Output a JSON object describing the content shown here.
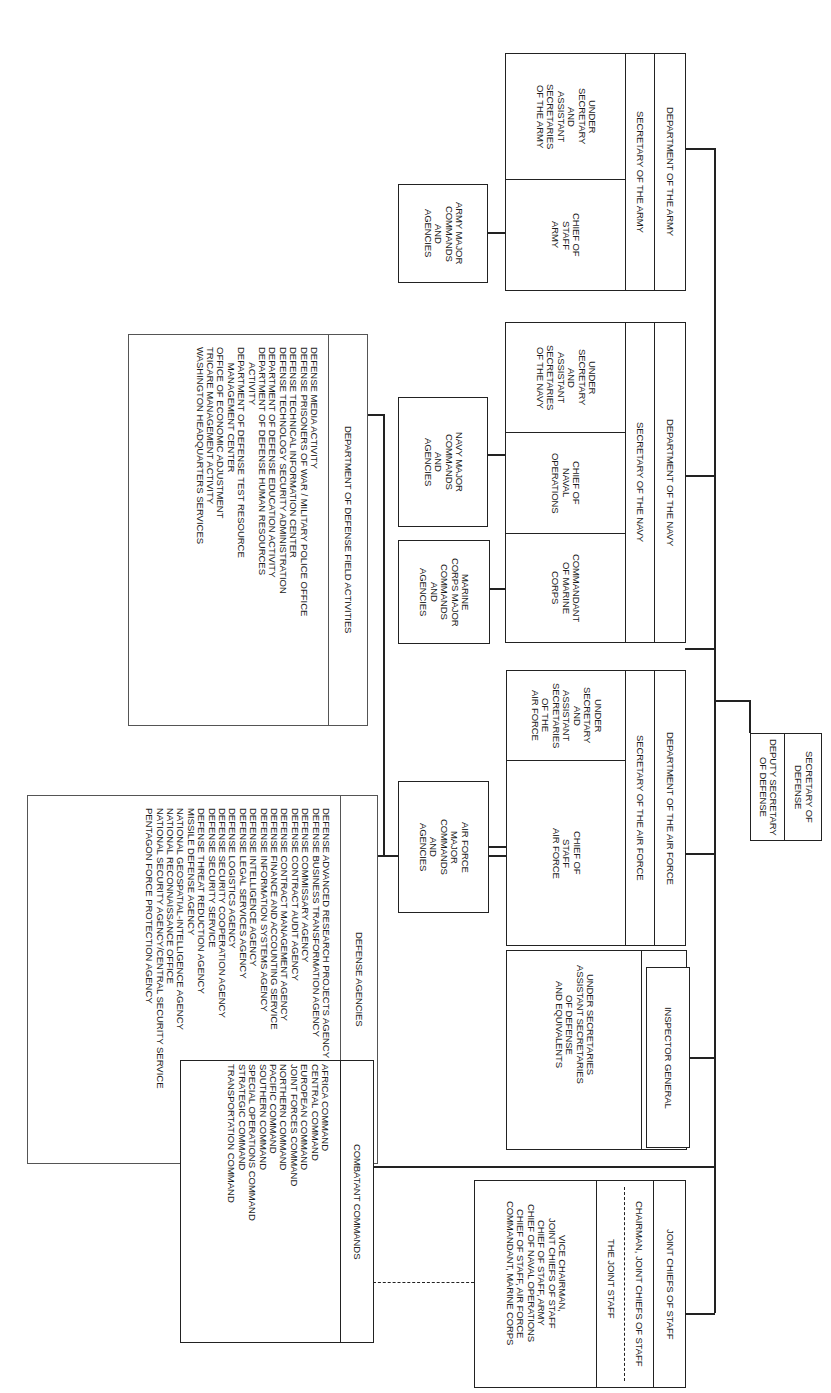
{
  "chart_title": "Department of Defense Organization",
  "secretary": {
    "title": "SECRETARY OF DEFENSE",
    "deputy": "DEPUTY SECRETARY OF DEFENSE"
  },
  "army": {
    "department": "DEPARTMENT OF THE ARMY",
    "secretary": "SECRETARY OF THE ARMY",
    "under_secretaries": "UNDER\nSECRETARY\nAND\nASSISTANT\nSECRETARIES\nOF THE ARMY",
    "chief": "CHIEF OF\nSTAFF\nARMY",
    "major_commands": "ARMY MAJOR\nCOMMANDS\nAND\nAGENCIES"
  },
  "navy": {
    "department": "DEPARTMENT OF THE NAVY",
    "secretary": "SECRETARY OF THE NAVY",
    "under_secretaries": "UNDER\nSECRETARY\nAND\nASSISTANT\nSECRETARIES\nOF THE NAVY",
    "chief": "CHIEF OF\nNAVAL\nOPERATIONS",
    "commandant": "COMMANDANT\nOF MARINE\nCORPS",
    "major_commands": "NAVY MAJOR\nCOMMANDS\nAND\nAGENCIES",
    "marine_commands": "MARINE\nCORPS MAJOR\nCOMMANDS\nAND\nAGENCIES"
  },
  "air_force": {
    "department": "DEPARTMENT OF THE AIR FORCE",
    "secretary": "SECRETARY OF THE AIR FORCE",
    "under_secretaries": "UNDER\nSECRETARY\nAND\nASSISTANT\nSECRETARIES\nOF THE\nAIR FORCE",
    "chief": "CHIEF OF\nSTAFF\nAIR FORCE",
    "major_commands": "AIR FORCE\nMAJOR\nCOMMANDS\nAND\nAGENCIES"
  },
  "osd": {
    "title": "OFFICE OF THE SECRETARY\nOF DEFENSE",
    "body": "UNDER SECRETARIES\nASSISTANT SECRETARIES\nOF DEFENSE\nAND EQUIVALENTS"
  },
  "inspector_general": "INSPECTOR GENERAL",
  "jcs": {
    "title": "JOINT CHIEFS OF STAFF",
    "chairman": "CHAIRMAN, JOINT CHIEFS OF STAFF",
    "joint_staff": "THE JOINT STAFF",
    "members": "VICE CHAIRMAN,\nJOINT CHIEFS OF STAFF\nCHIEF OF STAFF, ARMY\nCHIEF OF NAVAL OPERATIONS\nCHIEF OF STAFF, AIR FORCE\nCOMMANDANT, MARINE CORPS"
  },
  "field_activities": {
    "title": "DEPARTMENT OF DEFENSE FIELD ACTIVITIES",
    "items": "DEFENSE MEDIA ACTIVITY\nDEFENSE PRISONERS OF WAR / MILITARY POLICE OFFICE\nDEFENSE TECHNICAL INFORMATION CENTER\nDEFENSE TECHNOLOGY SECURITY ADMINISTRATION\nDEPARTMENT OF DEFENSE EDUCATION ACTIVITY\nDEPARTMENT OF DEFENSE HUMAN RESOURCES\n      ACTIVITY\nDEPARTMENT OF DEFENSE TEST RESOURCE\n      MANAGEMENT CENTER\nOFFICE OF ECONOMIC ADJUSTMENT\nTRICARE MANAGEMENT ACTIVITY\nWASHINGTON HEADQUARTERS SERVICES"
  },
  "defense_agencies": {
    "title": "DEFENSE AGENCIES",
    "items": "DEFENSE ADVANCED RESEARCH PROJECTS AGENCY\nDEFENSE BUSINESS TRANSFORMATION AGENCY\nDEFENSE COMMISSARY AGENCY\nDEFENSE CONTRACT AUDIT AGENCY\nDEFENSE CONTRACT MANAGEMENT AGENCY\nDEFENSE FINANCE AND ACCOUNTING SERVICE\nDEFENSE INFORMATION SYSTEMS AGENCY\nDEFENSE INTELLIGENCE AGENCY\nDEFENSE LEGAL SERVICES AGENCY\nDEFENSE LOGISTICS AGENCY\nDEFENSE SECURITY COOPERATION AGENCY\nDEFENSE SECURITY SERVICE\nDEFENSE THREAT REDUCTION AGENCY\nMISSILE DEFENSE AGENCY\nNATIONAL GEOSPATIAL-INTELLIGENCE AGENCY\nNATIONAL RECONNAISSANCE OFFICE\nNATIONAL SECURITY AGENCY/CENTRAL SECURITY SERVICE\nPENTAGON FORCE PROTECTION AGENCY"
  },
  "combatant_commands": {
    "title": "COMBATANT COMMANDS",
    "items": "AFRICA COMMAND\nCENTRAL COMMAND\nEUROPEAN COMMAND\nJOINT FORCES COMMAND\nNORTHERN COMMAND\nPACIFIC COMMAND\nSOUTHERN COMMAND\nSPECIAL OPERATIONS COMMAND\nSTRATEGIC COMMAND\nTRANSPORTATION COMMAND"
  }
}
